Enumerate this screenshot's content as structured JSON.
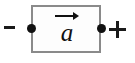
{
  "figure": {
    "background_color": "#ffffff"
  },
  "diagram": {
    "type": "physics-free-body-diagram",
    "body": {
      "shape": "rectangle",
      "border_color": "#8a8a8a",
      "fill_color": "#fdfdfd"
    },
    "terminals": [
      {
        "name": "negative-terminal",
        "sign_label": "-",
        "side": "left",
        "dot_color": "#111111"
      },
      {
        "name": "positive-terminal",
        "sign_label": "+",
        "side": "right",
        "dot_color": "#111111"
      }
    ],
    "vector": {
      "symbol": "a",
      "notation": "arrow-overbar",
      "direction": "right",
      "meaning": "acceleration",
      "color": "#111111"
    }
  }
}
